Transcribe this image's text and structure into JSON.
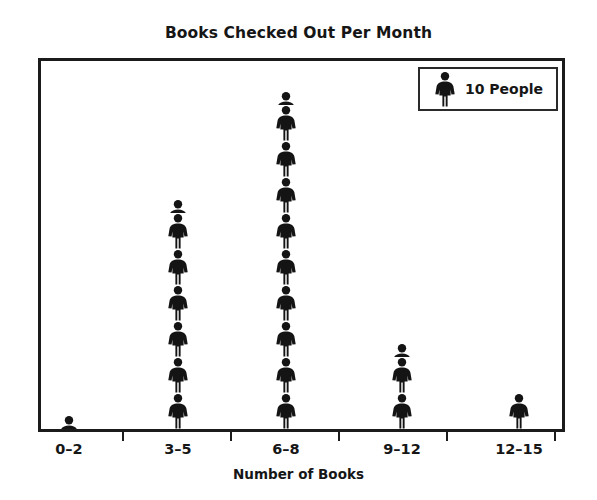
{
  "chart_data": {
    "type": "bar",
    "subtype": "pictogram",
    "title": "Books Checked Out Per Month",
    "xlabel": "Number of Books",
    "ylabel": "",
    "grid": false,
    "legend_position": "top-right",
    "icon": "person-icon",
    "icon_unit_value": 10,
    "legend_label": "10 People",
    "categories": [
      "0–2",
      "3–5",
      "6–8",
      "9–12",
      "12–15"
    ],
    "icon_counts": [
      0.4,
      6.4,
      9.4,
      2.4,
      1.0
    ],
    "values": [
      4,
      64,
      94,
      24,
      10
    ],
    "series": [
      {
        "name": "People",
        "values": [
          4,
          64,
          94,
          24,
          10
        ]
      }
    ],
    "colors": {
      "icon": "#141414",
      "frame": "#1b1b1b",
      "text": "#161616",
      "background": "#ffffff"
    }
  },
  "chart": {
    "title": "Books Checked Out Per Month",
    "axis": {
      "x_title": "Number of Books",
      "tick_labels": [
        "0–2",
        "3–5",
        "6–8",
        "9–12",
        "12–15"
      ]
    },
    "legend": {
      "label": "10 People",
      "icon_name": "person-icon"
    }
  }
}
